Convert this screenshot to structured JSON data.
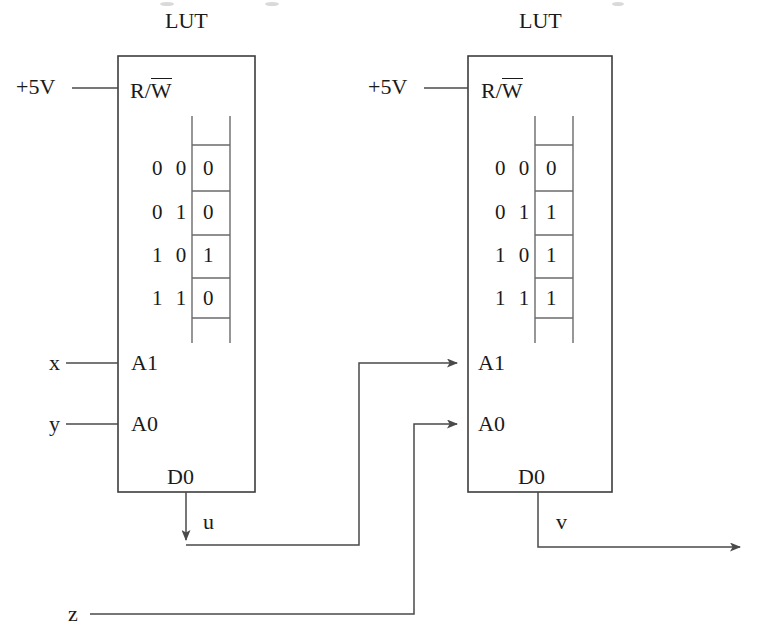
{
  "diagram": {
    "title_left": "LUT",
    "title_right": "LUT",
    "power_label_left": "+5V",
    "power_label_right": "+5V",
    "rw_pin_left_prefix": "R/",
    "rw_pin_left_bar": "W",
    "rw_pin_right_prefix": "R/",
    "rw_pin_right_bar": "W",
    "left_lut": {
      "name": "LUT",
      "pins": {
        "a1": "A1",
        "a0": "A0",
        "d0": "D0",
        "rw": "R/W"
      },
      "truth_table": {
        "rows": [
          {
            "addr": "0 0",
            "value": "0"
          },
          {
            "addr": "0 1",
            "value": "0"
          },
          {
            "addr": "1 0",
            "value": "1"
          },
          {
            "addr": "1 1",
            "value": "0"
          }
        ]
      }
    },
    "right_lut": {
      "name": "LUT",
      "pins": {
        "a1": "A1",
        "a0": "A0",
        "d0": "D0",
        "rw": "R/W"
      },
      "truth_table": {
        "rows": [
          {
            "addr": "0 0",
            "value": "0"
          },
          {
            "addr": "0 1",
            "value": "1"
          },
          {
            "addr": "1 0",
            "value": "1"
          },
          {
            "addr": "1 1",
            "value": "1"
          }
        ]
      }
    },
    "signals": {
      "x": "x",
      "y": "y",
      "z": "z",
      "u": "u",
      "v": "v"
    },
    "colors": {
      "line": "#4a4a4a",
      "box": "#3d3d3d",
      "text": "#1a1a1a",
      "background": "#ffffff"
    }
  }
}
